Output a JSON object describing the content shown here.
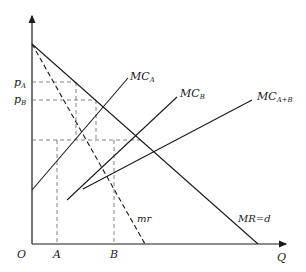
{
  "diagram": {
    "type": "economics-price-discrimination",
    "colors": {
      "line": "#1a1a1a",
      "dashed": "#555555",
      "background": "#ffffff"
    },
    "axes": {
      "origin_label": "O",
      "x_label": "Q",
      "y_ticks": [
        {
          "base": "p",
          "sub": "A"
        },
        {
          "base": "p",
          "sub": "B"
        }
      ],
      "x_ticks": [
        "A",
        "B"
      ]
    },
    "curves": {
      "mc_a": {
        "base": "MC",
        "sub": "A"
      },
      "mc_b": {
        "base": "MC",
        "sub": "B"
      },
      "mc_ab": {
        "base": "MC",
        "sub": "A+B"
      },
      "mr": {
        "label": "mr"
      },
      "demand": {
        "label": "MR=d"
      }
    }
  }
}
